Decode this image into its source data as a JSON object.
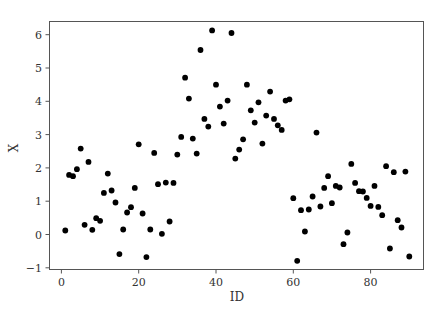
{
  "chart_data": {
    "type": "scatter",
    "title": "",
    "xlabel": "ID",
    "ylabel": "X",
    "xlim": [
      -3,
      93
    ],
    "ylim": [
      -1.15,
      6.45
    ],
    "xticks": [
      0,
      20,
      40,
      60,
      80
    ],
    "yticks": [
      -1,
      0,
      1,
      2,
      3,
      4,
      5,
      6
    ],
    "grid": false,
    "legend": null,
    "marker_color": "#000000",
    "series": [
      {
        "name": "X",
        "x": [
          1,
          2,
          3,
          4,
          5,
          6,
          7,
          8,
          9,
          10,
          11,
          12,
          13,
          14,
          15,
          16,
          17,
          18,
          19,
          20,
          21,
          22,
          23,
          24,
          25,
          26,
          27,
          28,
          29,
          30,
          31,
          32,
          33,
          34,
          35,
          36,
          37,
          38,
          39,
          40,
          41,
          42,
          43,
          44,
          45,
          46,
          47,
          48,
          49,
          50,
          51,
          52,
          53,
          54,
          55,
          56,
          57,
          58,
          59,
          60,
          61,
          62,
          63,
          64,
          65,
          66,
          67,
          68,
          69,
          70,
          71,
          72,
          73,
          74,
          75,
          76,
          77,
          78,
          79,
          80,
          81,
          82,
          83,
          84,
          85,
          86,
          87,
          88,
          89,
          90
        ],
        "y": [
          0.12,
          1.79,
          1.75,
          1.96,
          2.58,
          0.29,
          2.18,
          0.14,
          0.49,
          0.41,
          1.25,
          1.83,
          1.32,
          0.96,
          -0.59,
          0.15,
          0.66,
          0.82,
          1.4,
          2.71,
          0.63,
          -0.68,
          0.15,
          2.45,
          1.51,
          0.02,
          1.56,
          0.39,
          1.55,
          2.4,
          2.93,
          4.71,
          4.08,
          2.88,
          2.43,
          5.54,
          3.47,
          3.24,
          6.13,
          4.5,
          3.84,
          3.33,
          4.02,
          6.05,
          2.28,
          2.55,
          2.86,
          4.5,
          3.73,
          3.36,
          3.97,
          2.73,
          3.57,
          4.29,
          3.47,
          3.28,
          3.14,
          4.02,
          4.06,
          1.09,
          -0.79,
          0.73,
          0.09,
          0.75,
          1.14,
          3.06,
          0.84,
          1.4,
          1.75,
          0.94,
          1.46,
          1.41,
          -0.29,
          0.06,
          2.12,
          1.55,
          1.3,
          1.29,
          1.1,
          0.86,
          1.46,
          0.83,
          0.58,
          2.05,
          -0.42,
          1.87,
          0.43,
          0.21,
          1.89,
          -0.66
        ]
      }
    ]
  }
}
